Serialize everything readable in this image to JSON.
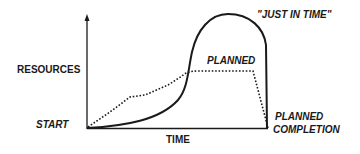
{
  "diagram": {
    "type": "resource-time curve comparison",
    "axes": {
      "y_label": "RESOURCES",
      "x_label": "TIME",
      "origin_label": "START",
      "end_label_line1": "PLANNED",
      "end_label_line2": "COMPLETION"
    },
    "curves": [
      {
        "name": "\"JUST IN TIME\"",
        "style": "solid",
        "label": "\"JUST IN TIME\""
      },
      {
        "name": "PLANNED",
        "style": "dotted",
        "label": "PLANNED"
      }
    ],
    "colors": {
      "line": "#1a1a1a",
      "background": "#ffffff"
    }
  }
}
